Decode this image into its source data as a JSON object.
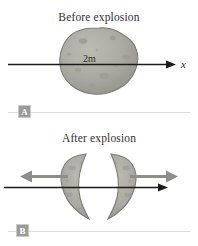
{
  "figure": {
    "title_a": "Before explosion",
    "title_b": "After explosion",
    "badge_a": "A",
    "badge_b": "B",
    "axis_label_a": "x",
    "axis_label_b": "x",
    "mass_before": "2m",
    "mass_left": "m",
    "mass_right": "m",
    "velocity_left": "−v",
    "velocity_left_sub": "f",
    "velocity_right": "+v",
    "velocity_right_sub": "f",
    "colors": {
      "rock_fill": "#a9a9a2",
      "rock_stroke": "#7d7d76",
      "axis": "#1a1a1a",
      "velocity_arrow": "#8e8e88",
      "divider": "#dcdcd8",
      "badge_bg": "#9a9a96",
      "text": "#2f2f2f"
    }
  }
}
